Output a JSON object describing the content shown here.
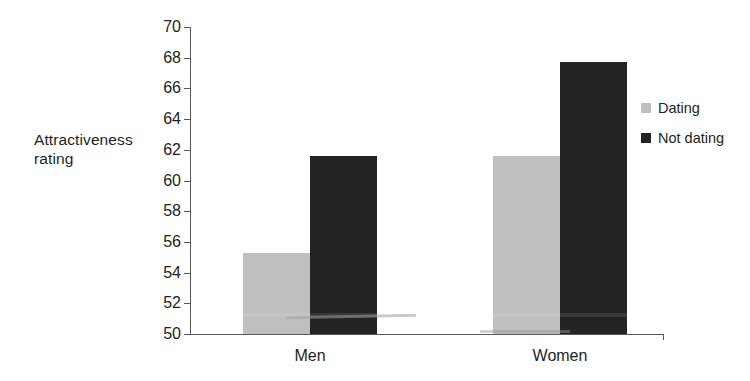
{
  "chart_data": {
    "type": "bar",
    "title": "",
    "xlabel": "",
    "ylabel": "Attractiveness rating",
    "ylabel_lines": [
      "Attractiveness",
      "rating"
    ],
    "categories": [
      "Men",
      "Women"
    ],
    "series": [
      {
        "name": "Dating",
        "values": [
          55.3,
          61.6
        ],
        "color": "#bfbfbf"
      },
      {
        "name": "Not dating",
        "values": [
          61.6,
          67.7
        ],
        "color": "#232323"
      }
    ],
    "ylim": [
      50,
      70
    ],
    "ytick_step": 2,
    "yticks": [
      50,
      52,
      54,
      56,
      58,
      60,
      62,
      64,
      66,
      68,
      70
    ],
    "ytick_labels": [
      "50",
      "52",
      "54",
      "56",
      "58",
      "60",
      "62",
      "64",
      "66",
      "68",
      "70"
    ],
    "grid": false,
    "legend_position": "right"
  },
  "legend": {
    "items": [
      {
        "label": "Dating",
        "color": "#bfbfbf"
      },
      {
        "label": "Not dating",
        "color": "#232323"
      }
    ]
  },
  "axis": {
    "y_label_line1": "Attractiveness",
    "y_label_line2": "rating"
  }
}
